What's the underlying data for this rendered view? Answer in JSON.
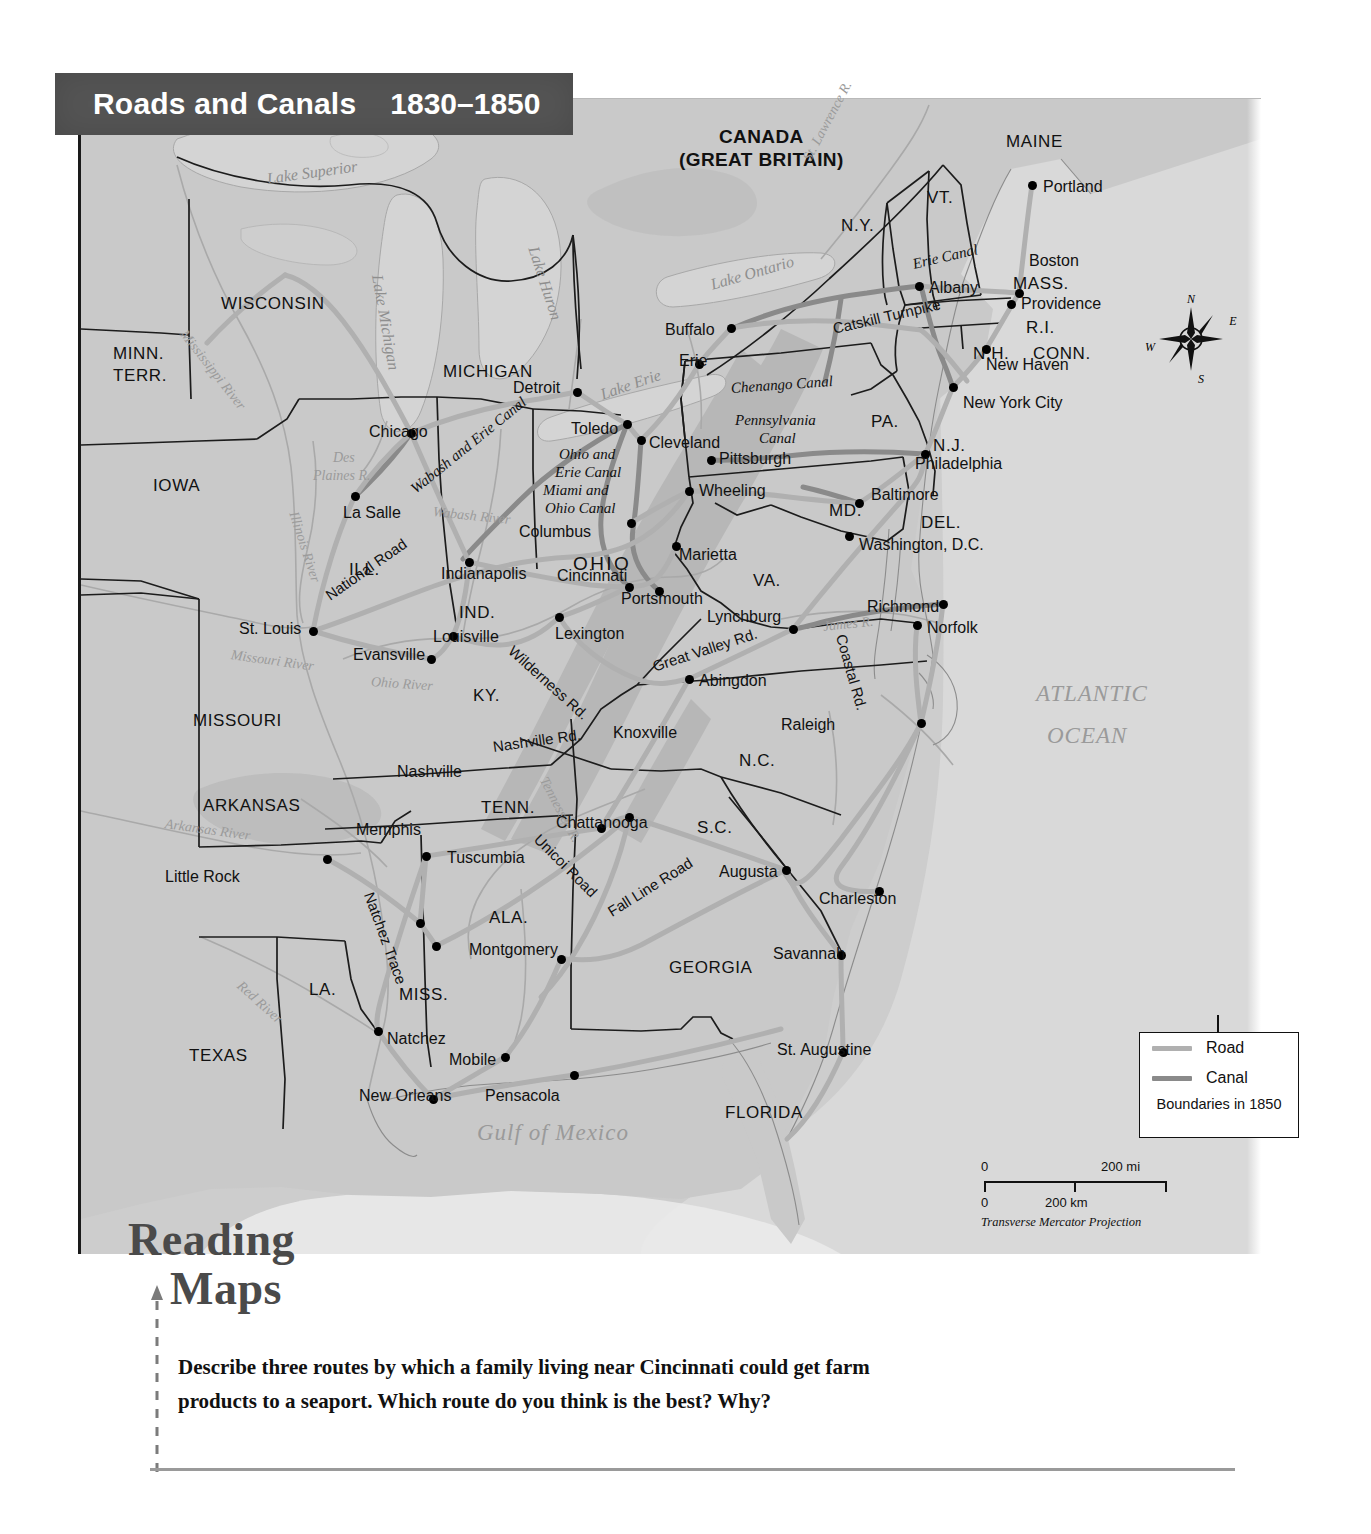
{
  "title": {
    "main": "Roads and Canals",
    "years": "1830–1850"
  },
  "legend": {
    "road_label": "Road",
    "canal_label": "Canal",
    "boundaries_note": "Boundaries in 1850",
    "road_color": "#b0b0b0",
    "canal_color": "#8a8a8a"
  },
  "scale": {
    "mi_zero": "0",
    "mi_max": "200 mi",
    "km_zero": "0",
    "km_mid": "200 km",
    "projection": "Transverse Mercator Projection"
  },
  "compass": {
    "n": "N",
    "e": "E",
    "s": "S",
    "w": "W"
  },
  "reading": {
    "heading_line1": "Reading",
    "heading_line2": "Maps",
    "question": "Describe three routes by which a family living near Cincinnati could get farm products to a seaport. Which route do you think is the best? Why?"
  },
  "country_labels": [
    {
      "line1": "CANADA",
      "line2": "(GREAT BRITAIN)",
      "x": 598,
      "y": 28
    }
  ],
  "states": [
    {
      "name": "MAINE",
      "x": 925,
      "y": 34,
      "size": "state"
    },
    {
      "name": "VT.",
      "x": 846,
      "y": 90,
      "size": "state"
    },
    {
      "name": "N.H.",
      "x": 892,
      "y": 246,
      "size": "state"
    },
    {
      "name": "N.Y.",
      "x": 760,
      "y": 118,
      "size": "state"
    },
    {
      "name": "MASS.",
      "x": 932,
      "y": 176,
      "size": "state"
    },
    {
      "name": "R.I.",
      "x": 945,
      "y": 220,
      "size": "state"
    },
    {
      "name": "CONN.",
      "x": 952,
      "y": 246,
      "size": "state"
    },
    {
      "name": "PA.",
      "x": 790,
      "y": 314,
      "size": "state"
    },
    {
      "name": "N.J.",
      "x": 852,
      "y": 338,
      "size": "state"
    },
    {
      "name": "MD.",
      "x": 748,
      "y": 403,
      "size": "state"
    },
    {
      "name": "DEL.",
      "x": 840,
      "y": 415,
      "size": "state"
    },
    {
      "name": "VA.",
      "x": 672,
      "y": 473,
      "size": "state"
    },
    {
      "name": "N.C.",
      "x": 658,
      "y": 653,
      "size": "state"
    },
    {
      "name": "S.C.",
      "x": 616,
      "y": 720,
      "size": "state"
    },
    {
      "name": "GEORGIA",
      "x": 588,
      "y": 860,
      "size": "state"
    },
    {
      "name": "FLORIDA",
      "x": 644,
      "y": 1005,
      "size": "state"
    },
    {
      "name": "ALA.",
      "x": 408,
      "y": 810,
      "size": "state"
    },
    {
      "name": "MISS.",
      "x": 318,
      "y": 887,
      "size": "state"
    },
    {
      "name": "LA.",
      "x": 228,
      "y": 882,
      "size": "state"
    },
    {
      "name": "TEXAS",
      "x": 108,
      "y": 948,
      "size": "state"
    },
    {
      "name": "ARKANSAS",
      "x": 122,
      "y": 698,
      "size": "state"
    },
    {
      "name": "MISSOURI",
      "x": 112,
      "y": 613,
      "size": "state"
    },
    {
      "name": "TENN.",
      "x": 400,
      "y": 700,
      "size": "state"
    },
    {
      "name": "KY.",
      "x": 392,
      "y": 588,
      "size": "state"
    },
    {
      "name": "IND.",
      "x": 378,
      "y": 505,
      "size": "state"
    },
    {
      "name": "ILL.",
      "x": 268,
      "y": 462,
      "size": "state"
    },
    {
      "name": "OHIO",
      "x": 492,
      "y": 455,
      "size": "state lg"
    },
    {
      "name": "IOWA",
      "x": 72,
      "y": 378,
      "size": "state"
    },
    {
      "name": "MICHIGAN",
      "x": 362,
      "y": 264,
      "size": "state"
    },
    {
      "name": "WISCONSIN",
      "x": 140,
      "y": 196,
      "size": "state"
    },
    {
      "name": "MINN.",
      "x": 32,
      "y": 246,
      "size": "state"
    },
    {
      "name": "TERR.",
      "x": 32,
      "y": 268,
      "size": "state"
    }
  ],
  "cities": [
    {
      "name": "Portland",
      "dx": 951,
      "dy": 86,
      "lx": 962,
      "ly": 80
    },
    {
      "name": "Boston",
      "dx": 938,
      "dy": 194,
      "lx": 948,
      "ly": 154
    },
    {
      "name": "Providence",
      "dx": 930,
      "dy": 205,
      "lx": 940,
      "ly": 197
    },
    {
      "name": "New Haven",
      "dx": 905,
      "dy": 250,
      "lx": 905,
      "ly": 258
    },
    {
      "name": "New York City",
      "dx": 872,
      "dy": 288,
      "lx": 882,
      "ly": 296
    },
    {
      "name": "Albany",
      "dx": 838,
      "dy": 187,
      "lx": 848,
      "ly": 181
    },
    {
      "name": "Buffalo",
      "dx": 650,
      "dy": 229,
      "lx": 584,
      "ly": 223
    },
    {
      "name": "Erie",
      "dx": 618,
      "dy": 265,
      "lx": 598,
      "ly": 254
    },
    {
      "name": "Philadelphia",
      "dx": 844,
      "dy": 355,
      "lx": 834,
      "ly": 357
    },
    {
      "name": "Baltimore",
      "dx": 778,
      "dy": 404,
      "lx": 790,
      "ly": 388
    },
    {
      "name": "Washington, D.C.",
      "dx": 768,
      "dy": 437,
      "lx": 778,
      "ly": 438
    },
    {
      "name": "Pittsburgh",
      "dx": 630,
      "dy": 361,
      "lx": 638,
      "ly": 352
    },
    {
      "name": "Wheeling",
      "dx": 608,
      "dy": 392,
      "lx": 618,
      "ly": 384
    },
    {
      "name": "Cleveland",
      "dx": 560,
      "dy": 341,
      "lx": 568,
      "ly": 336
    },
    {
      "name": "Toledo",
      "dx": 546,
      "dy": 325,
      "lx": 490,
      "ly": 322
    },
    {
      "name": "Detroit",
      "dx": 496,
      "dy": 293,
      "lx": 432,
      "ly": 281
    },
    {
      "name": "Chicago",
      "dx": 330,
      "dy": 334,
      "lx": 288,
      "ly": 325
    },
    {
      "name": "La Salle",
      "dx": 274,
      "dy": 397,
      "lx": 262,
      "ly": 406
    },
    {
      "name": "St. Louis",
      "dx": 232,
      "dy": 532,
      "lx": 158,
      "ly": 522
    },
    {
      "name": "Evansville",
      "dx": 350,
      "dy": 560,
      "lx": 272,
      "ly": 548
    },
    {
      "name": "Indianapolis",
      "dx": 388,
      "dy": 463,
      "lx": 360,
      "ly": 467
    },
    {
      "name": "Columbus",
      "dx": 550,
      "dy": 424,
      "lx": 438,
      "ly": 425
    },
    {
      "name": "Cincinnati",
      "dx": 548,
      "dy": 488,
      "lx": 476,
      "ly": 469
    },
    {
      "name": "Portsmouth",
      "dx": 578,
      "dy": 492,
      "lx": 540,
      "ly": 492
    },
    {
      "name": "Marietta",
      "dx": 595,
      "dy": 447,
      "lx": 598,
      "ly": 448
    },
    {
      "name": "Louisville",
      "dx": 372,
      "dy": 537,
      "lx": 352,
      "ly": 530
    },
    {
      "name": "Lexington",
      "dx": 478,
      "dy": 518,
      "lx": 474,
      "ly": 527
    },
    {
      "name": "Lynchburg",
      "dx": 712,
      "dy": 530,
      "lx": 626,
      "ly": 510
    },
    {
      "name": "Richmond",
      "dx": 862,
      "dy": 505,
      "lx": 786,
      "ly": 500
    },
    {
      "name": "Norfolk",
      "dx": 836,
      "dy": 526,
      "lx": 846,
      "ly": 521
    },
    {
      "name": "Abingdon",
      "dx": 608,
      "dy": 580,
      "lx": 618,
      "ly": 574
    },
    {
      "name": "Raleigh",
      "dx": 840,
      "dy": 624,
      "lx": 700,
      "ly": 618
    },
    {
      "name": "Knoxville",
      "dx": 520,
      "dy": 729,
      "lx": 532,
      "ly": 626
    },
    {
      "name": "Nashville",
      "dx": 345,
      "dy": 757,
      "lx": 316,
      "ly": 665
    },
    {
      "name": "Memphis",
      "dx": 339,
      "dy": 824,
      "lx": 275,
      "ly": 723
    },
    {
      "name": "Tuscumbia",
      "dx": 355,
      "dy": 847,
      "lx": 366,
      "ly": 751
    },
    {
      "name": "Chattanooga",
      "dx": 548,
      "dy": 718,
      "lx": 475,
      "ly": 716
    },
    {
      "name": "Montgomery",
      "dx": 480,
      "dy": 860,
      "lx": 388,
      "ly": 843
    },
    {
      "name": "Augusta",
      "dx": 705,
      "dy": 771,
      "lx": 638,
      "ly": 765
    },
    {
      "name": "Charleston",
      "dx": 798,
      "dy": 792,
      "lx": 738,
      "ly": 792
    },
    {
      "name": "Savannah",
      "dx": 760,
      "dy": 856,
      "lx": 692,
      "ly": 847
    },
    {
      "name": "St. Augustine",
      "dx": 762,
      "dy": 953,
      "lx": 696,
      "ly": 943
    },
    {
      "name": "Little Rock",
      "dx": 246,
      "dy": 760,
      "lx": 84,
      "ly": 770
    },
    {
      "name": "Natchez",
      "dx": 297,
      "dy": 932,
      "lx": 306,
      "ly": 932
    },
    {
      "name": "Mobile",
      "dx": 424,
      "dy": 958,
      "lx": 368,
      "ly": 953
    },
    {
      "name": "New Orleans",
      "dx": 352,
      "dy": 1000,
      "lx": 278,
      "ly": 989
    },
    {
      "name": "Pensacola",
      "dx": 493,
      "dy": 976,
      "lx": 404,
      "ly": 989
    }
  ],
  "routes": [
    {
      "name": "Erie Canal",
      "x": 832,
      "y": 158,
      "rot": -13,
      "style": "route"
    },
    {
      "name": "Catskill Turnpike",
      "x": 752,
      "y": 222,
      "rot": -13,
      "style": "route rd"
    },
    {
      "name": "Chenango Canal",
      "x": 650,
      "y": 282,
      "rot": -4,
      "style": "route"
    },
    {
      "name": "Pennsylvania",
      "x": 654,
      "y": 314,
      "rot": 0,
      "style": "route"
    },
    {
      "name": "Canal",
      "x": 678,
      "y": 332,
      "rot": 0,
      "style": "route"
    },
    {
      "name": "Ohio and",
      "x": 478,
      "y": 348,
      "rot": 0,
      "style": "route"
    },
    {
      "name": "Erie Canal",
      "x": 474,
      "y": 366,
      "rot": 0,
      "style": "route"
    },
    {
      "name": "Miami and",
      "x": 462,
      "y": 384,
      "rot": 0,
      "style": "route"
    },
    {
      "name": "Ohio Canal",
      "x": 464,
      "y": 402,
      "rot": 0,
      "style": "route"
    },
    {
      "name": "Wabash and Erie Canal",
      "x": 332,
      "y": 384,
      "rot": -39,
      "style": "route"
    },
    {
      "name": "National Road",
      "x": 246,
      "y": 490,
      "rot": -35,
      "style": "route rd"
    },
    {
      "name": "Wilderness Rd.",
      "x": 430,
      "y": 542,
      "rot": 42,
      "style": "route rd"
    },
    {
      "name": "Great Valley Rd.",
      "x": 572,
      "y": 560,
      "rot": -18,
      "style": "route rd"
    },
    {
      "name": "Coastal Rd.",
      "x": 760,
      "y": 528,
      "rot": 74,
      "style": "route rd"
    },
    {
      "name": "Nashville Rd.",
      "x": 412,
      "y": 640,
      "rot": -8,
      "style": "route rd"
    },
    {
      "name": "Natchez Trace",
      "x": 288,
      "y": 786,
      "rot": 70,
      "style": "route rd"
    },
    {
      "name": "Unicoi Road",
      "x": 456,
      "y": 730,
      "rot": 45,
      "style": "route rd"
    },
    {
      "name": "Fall Line Road",
      "x": 528,
      "y": 806,
      "rot": -32,
      "style": "route rd"
    }
  ],
  "waters": [
    {
      "name": "Lake Superior",
      "x": 186,
      "y": 72,
      "rot": -8,
      "cls": "water"
    },
    {
      "name": "Lake Huron",
      "x": 452,
      "y": 140,
      "rot": 72,
      "cls": "water"
    },
    {
      "name": "Lake Michigan",
      "x": 296,
      "y": 168,
      "rot": 80,
      "cls": "water"
    },
    {
      "name": "Lake Ontario",
      "x": 630,
      "y": 178,
      "rot": -16,
      "cls": "water"
    },
    {
      "name": "Lake Erie",
      "x": 520,
      "y": 288,
      "rot": -19,
      "cls": "water"
    },
    {
      "name": "St. Lawrence R.",
      "x": 726,
      "y": 54,
      "rot": -62,
      "cls": "water riv"
    },
    {
      "name": "Mississippi River",
      "x": 102,
      "y": 226,
      "rot": 52,
      "cls": "water riv"
    },
    {
      "name": "Illinois River",
      "x": 212,
      "y": 406,
      "rot": 72,
      "cls": "water riv"
    },
    {
      "name": "Des",
      "x": 252,
      "y": 352,
      "rot": 0,
      "cls": "water riv"
    },
    {
      "name": "Plaines R.",
      "x": 232,
      "y": 370,
      "rot": 0,
      "cls": "water riv"
    },
    {
      "name": "Wabash River",
      "x": 352,
      "y": 406,
      "rot": 6,
      "cls": "water riv"
    },
    {
      "name": "Ohio River",
      "x": 290,
      "y": 576,
      "rot": 4,
      "cls": "water riv"
    },
    {
      "name": "Missouri River",
      "x": 150,
      "y": 549,
      "rot": 8,
      "cls": "water riv"
    },
    {
      "name": "Arkansas River",
      "x": 84,
      "y": 718,
      "rot": 8,
      "cls": "water riv"
    },
    {
      "name": "Red River",
      "x": 158,
      "y": 878,
      "rot": 42,
      "cls": "water riv"
    },
    {
      "name": "Tennessee R.",
      "x": 462,
      "y": 672,
      "rot": 62,
      "cls": "water riv"
    },
    {
      "name": "James R.",
      "x": 742,
      "y": 521,
      "rot": -6,
      "cls": "water riv"
    },
    {
      "name": "Gulf of Mexico",
      "x": 396,
      "y": 1022,
      "rot": 0,
      "cls": "water big"
    },
    {
      "name": "ATLANTIC",
      "x": 955,
      "y": 583,
      "rot": 0,
      "cls": "water big"
    },
    {
      "name": "OCEAN",
      "x": 966,
      "y": 625,
      "rot": 0,
      "cls": "water big"
    }
  ]
}
